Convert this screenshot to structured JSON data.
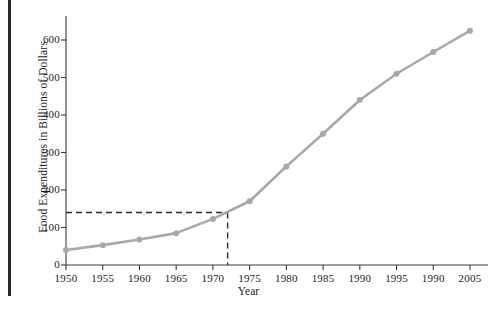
{
  "chart_data": {
    "type": "line",
    "title": "",
    "xlabel": "Year",
    "ylabel": "Food Expenditures in Billions of Dollars",
    "x": [
      1950,
      1955,
      1960,
      1965,
      1970,
      1975,
      1980,
      1985,
      1990,
      1995,
      2000,
      2005
    ],
    "xtick_labels": [
      "1950",
      "1955",
      "1960",
      "1965",
      "1970",
      "1975",
      "1980",
      "1985",
      "1990",
      "1995",
      "1990",
      "2005"
    ],
    "values": [
      40,
      53,
      68,
      85,
      123,
      170,
      263,
      350,
      440,
      510,
      568,
      625
    ],
    "series": [
      {
        "name": "Food Expenditures",
        "values": [
          40,
          53,
          68,
          85,
          123,
          170,
          263,
          350,
          440,
          510,
          568,
          625
        ]
      }
    ],
    "ytick_labels": [
      "0",
      "100",
      "200",
      "300",
      "400",
      "500",
      "600"
    ],
    "yticks": [
      0,
      100,
      200,
      300,
      400,
      500,
      600
    ],
    "xlim": [
      1950,
      2007
    ],
    "ylim": [
      0,
      640
    ],
    "grid": false,
    "legend": false,
    "line_color": "#a8a8a8",
    "marker_color": "#a8a8a8",
    "axis_color": "#3a3a3a",
    "annotations": [
      {
        "name": "reference-guide",
        "style": "dashed",
        "color": "#2b2b2b",
        "y_value": 140,
        "x_value": 1972
      }
    ]
  }
}
